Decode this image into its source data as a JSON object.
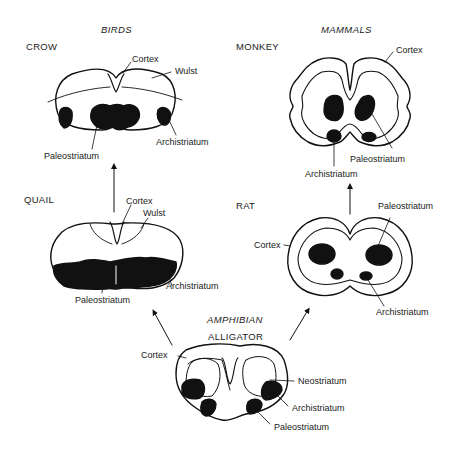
{
  "groups": {
    "birds": "BIRDS",
    "mammals": "MAMMALS",
    "amphibian": "AMPHIBIAN"
  },
  "species": {
    "crow": "CROW",
    "quail": "QUAIL",
    "monkey": "MONKEY",
    "rat": "RAT",
    "alligator": "ALLIGATOR"
  },
  "labels": {
    "crow": {
      "cortex": "Cortex",
      "wulst": "Wulst",
      "paleostriatum": "Paleostriatum",
      "archistriatum": "Archistriatum"
    },
    "quail": {
      "cortex": "Cortex",
      "wulst": "Wulst",
      "paleostriatum": "Paleostriatum",
      "archistriatum": "Archistriatum"
    },
    "monkey": {
      "cortex": "Cortex",
      "paleostriatum": "Paleostriatum",
      "archistriatum": "Archistriatum"
    },
    "rat": {
      "cortex": "Cortex",
      "paleostriatum": "Paleostriatum",
      "archistriatum": "Archistriatum"
    },
    "alligator": {
      "cortex": "Cortex",
      "neostriatum": "Neostriatum",
      "archistriatum": "Archistriatum",
      "paleostriatum": "Paleostriatum"
    }
  },
  "arrows": [
    {
      "from": "alligator",
      "to": "quail"
    },
    {
      "from": "quail",
      "to": "crow"
    },
    {
      "from": "alligator",
      "to": "rat"
    },
    {
      "from": "rat",
      "to": "monkey"
    }
  ]
}
